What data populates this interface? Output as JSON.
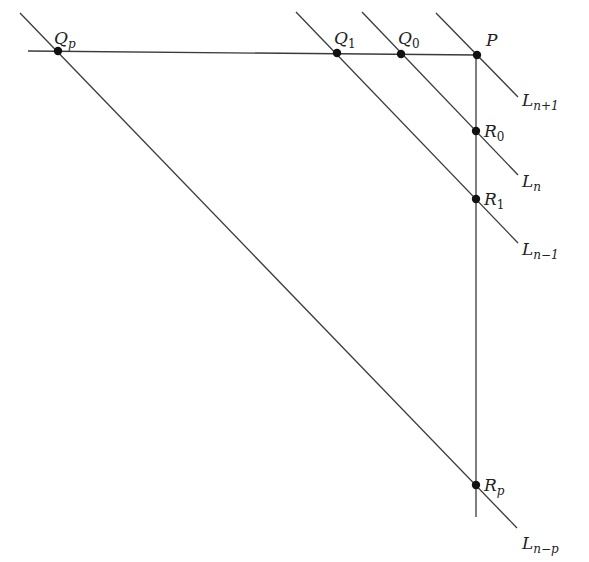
{
  "diagram": {
    "points": [
      {
        "id": "Qp",
        "base": "Q",
        "sub": "p",
        "x": 58,
        "y": 51,
        "lx": 54,
        "ly": 44
      },
      {
        "id": "Q1",
        "base": "Q",
        "sub": "1",
        "x": 337,
        "y": 53,
        "lx": 334,
        "ly": 44
      },
      {
        "id": "Q0",
        "base": "Q",
        "sub": "0",
        "x": 401,
        "y": 54,
        "lx": 398,
        "ly": 44
      },
      {
        "id": "P",
        "base": "P",
        "sub": "",
        "x": 477,
        "y": 55,
        "lx": 486,
        "ly": 46
      },
      {
        "id": "R0",
        "base": "R",
        "sub": "0",
        "x": 476,
        "y": 131,
        "lx": 484,
        "ly": 137
      },
      {
        "id": "R1",
        "base": "R",
        "sub": "1",
        "x": 476,
        "y": 199,
        "lx": 484,
        "ly": 205
      },
      {
        "id": "Rp",
        "base": "R",
        "sub": "p",
        "x": 476,
        "y": 485,
        "lx": 484,
        "ly": 491
      }
    ],
    "lines": [
      {
        "id": "horizontal",
        "x1": 28,
        "y1": 51,
        "x2": 477,
        "y2": 55
      },
      {
        "id": "vertical",
        "x1": 476,
        "y1": 55,
        "x2": 476,
        "y2": 517
      },
      {
        "id": "L_n+1",
        "x1": 436,
        "y1": 13,
        "x2": 518,
        "y2": 97
      },
      {
        "id": "L_n",
        "x1": 362,
        "y1": 12,
        "x2": 518,
        "y2": 175
      },
      {
        "id": "L_n-1",
        "x1": 296,
        "y1": 12,
        "x2": 518,
        "y2": 243
      },
      {
        "id": "L_n-p",
        "x1": 20,
        "y1": 13,
        "x2": 517,
        "y2": 528
      }
    ],
    "line_labels": [
      {
        "id": "L_n+1",
        "base": "L",
        "sub": "n+1",
        "x": 522,
        "y": 106
      },
      {
        "id": "L_n",
        "base": "L",
        "sub": "n",
        "x": 522,
        "y": 187
      },
      {
        "id": "L_n-1",
        "base": "L",
        "sub": "n−1",
        "x": 522,
        "y": 255
      },
      {
        "id": "L_n-p",
        "base": "L",
        "sub": "n−p",
        "x": 522,
        "y": 549
      }
    ]
  }
}
